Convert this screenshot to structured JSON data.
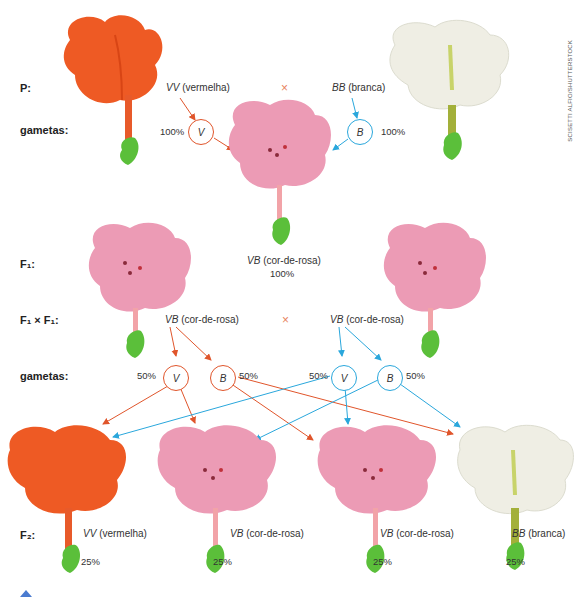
{
  "credit": "SCISETTI ALFIO/SHUTTERSTOCK",
  "colors": {
    "red_arrow": "#e0552b",
    "blue_arrow": "#2aa7dc",
    "red_flower": "#ee5a24",
    "pink_flower": "#ec9bb5",
    "white_flower": "#efeee4",
    "leaf": "#5bbf3a"
  },
  "parental": {
    "label": "P:",
    "left": {
      "genotype": "VV",
      "phenotype": "(vermelha)"
    },
    "cross_symbol": "×",
    "right": {
      "genotype": "BB",
      "phenotype": "(branca)"
    }
  },
  "gametes_p": {
    "label": "gametas:",
    "left": {
      "allele": "V",
      "pct": "100%"
    },
    "right": {
      "allele": "B",
      "pct": "100%"
    }
  },
  "f1": {
    "label": "F₁:",
    "genotype": "VB",
    "phenotype": "(cor-de-rosa)",
    "pct": "100%"
  },
  "f1_cross": {
    "label": "F₁ × F₁:",
    "left": {
      "genotype": "VB",
      "phenotype": "(cor-de-rosa)"
    },
    "cross_symbol": "×",
    "right": {
      "genotype": "VB",
      "phenotype": "(cor-de-rosa)"
    }
  },
  "gametes_f1": {
    "label": "gametas:",
    "items": [
      {
        "allele": "V",
        "pct": "50%"
      },
      {
        "allele": "B",
        "pct": "50%"
      },
      {
        "allele": "V",
        "pct": "50%"
      },
      {
        "allele": "B",
        "pct": "50%"
      }
    ]
  },
  "f2": {
    "label": "F₂:",
    "items": [
      {
        "genotype": "VV",
        "phenotype": "(vermelha)",
        "pct": "25%"
      },
      {
        "genotype": "VB",
        "phenotype": "(cor-de-rosa)",
        "pct": "25%"
      },
      {
        "genotype": "VB",
        "phenotype": "(cor-de-rosa)",
        "pct": "25%"
      },
      {
        "genotype": "BB",
        "phenotype": "(branca)",
        "pct": "25%"
      }
    ]
  }
}
